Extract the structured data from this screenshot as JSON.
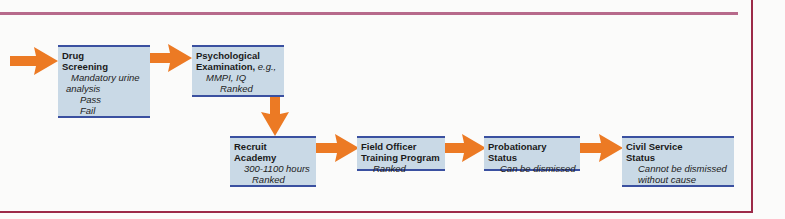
{
  "colors": {
    "box_fill": "#c9d9e6",
    "box_border": "#3a50a0",
    "arrow": "#ec7a24",
    "pass": "#3a8a3a",
    "fail": "#c8303a",
    "top_rule": "#b76a8b",
    "frame_rule": "#9c2a48"
  },
  "steps": [
    {
      "id": "drug-screening",
      "title_line1": "Drug",
      "title_line2": "Screening",
      "notes": [
        "Mandatory urine",
        "analysis"
      ],
      "outcomes": {
        "pass": "Pass",
        "fail": "Fail"
      }
    },
    {
      "id": "psychological-examination",
      "title_line1": "Psychological",
      "title_line2": "Examination,",
      "title_suffix": "e.g.,",
      "notes": [
        "MMPI, IQ",
        "Ranked"
      ]
    },
    {
      "id": "recruit-academy",
      "title_line1": "Recruit",
      "title_line2": "Academy",
      "notes": [
        "300-1100 hours",
        "Ranked"
      ]
    },
    {
      "id": "field-officer-training",
      "title_line1": "Field Officer",
      "title_line2": "Training Program",
      "notes": [
        "Ranked"
      ]
    },
    {
      "id": "probationary-status",
      "title_line1": "Probationary",
      "title_line2": "Status",
      "notes": [
        "Can be dismissed"
      ]
    },
    {
      "id": "civil-service-status",
      "title_line1": "Civil Service",
      "title_line2": "Status",
      "notes": [
        "Cannot be dismissed",
        "without cause"
      ]
    }
  ]
}
